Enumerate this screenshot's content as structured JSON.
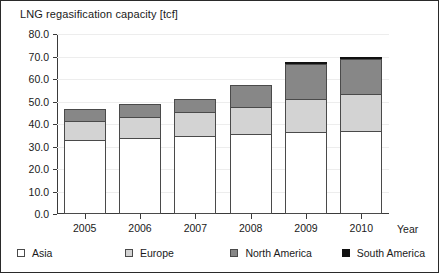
{
  "chart_data": {
    "type": "bar",
    "subtype": "stacked-column",
    "title": "LNG regasification capacity [tcf]",
    "xlabel": "Year",
    "ylabel": "",
    "categories": [
      "2005",
      "2006",
      "2007",
      "2008",
      "2009",
      "2010"
    ],
    "series": [
      {
        "name": "Asia",
        "color": "#ffffff",
        "values": [
          33.0,
          34.0,
          34.5,
          35.5,
          36.5,
          37.0
        ]
      },
      {
        "name": "Europe",
        "color": "#d3d3d3",
        "values": [
          8.5,
          9.0,
          11.0,
          12.0,
          14.5,
          16.5
        ]
      },
      {
        "name": "North America",
        "color": "#878787",
        "values": [
          5.0,
          6.0,
          5.5,
          10.0,
          15.5,
          15.5
        ]
      },
      {
        "name": "South America",
        "color": "#111111",
        "values": [
          0.0,
          0.0,
          0.0,
          0.0,
          1.0,
          1.0
        ]
      }
    ],
    "totals": [
      46.5,
      49.0,
      51.0,
      57.5,
      67.5,
      70.0
    ],
    "ylim": [
      0.0,
      80.0
    ],
    "ytick_step": 10.0,
    "yticks": [
      "80.0",
      "70.0",
      "60.0",
      "50.0",
      "40.0",
      "30.0",
      "20.0",
      "10.0",
      "0.0"
    ],
    "grid": true,
    "legend_position": "bottom"
  },
  "legend": {
    "items": [
      {
        "label": "Asia",
        "swatch": "swatch-asia"
      },
      {
        "label": "Europe",
        "swatch": "swatch-europe"
      },
      {
        "label": "North America",
        "swatch": "swatch-north-america"
      },
      {
        "label": "South America",
        "swatch": "swatch-south-america"
      }
    ]
  }
}
